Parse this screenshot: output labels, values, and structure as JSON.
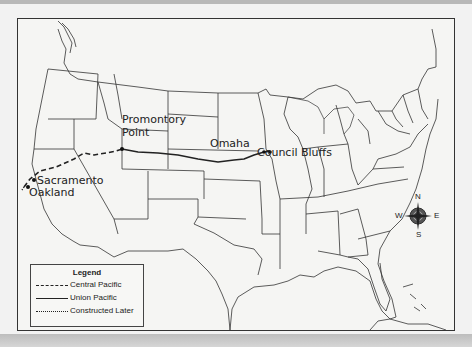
{
  "map": {
    "subject": "United States — Transcontinental Railroad routes",
    "places": [
      {
        "name": "Promontory Point",
        "line1": "Promontory",
        "line2": "Point"
      },
      {
        "name": "Sacramento"
      },
      {
        "name": "Oakland"
      },
      {
        "name": "Omaha"
      },
      {
        "name": "Council Bluffs"
      }
    ],
    "labels": {
      "promontory_1": "Promontory",
      "promontory_2": "Point",
      "sacramento": "Sacramento",
      "oakland": "Oakland",
      "omaha": "Omaha",
      "council_bluffs": "Council Bluffs"
    },
    "compass": {
      "n": "N",
      "s": "S",
      "e": "E",
      "w": "W"
    },
    "legend": {
      "title": "Legend",
      "items": [
        {
          "label": "Central Pacific",
          "style": "dashed"
        },
        {
          "label": "Union Pacific",
          "style": "solid"
        },
        {
          "label": "Constructed Later",
          "style": "dotted"
        }
      ]
    },
    "colors": {
      "background": "#f5f5f3",
      "outline": "#333333",
      "route": "#222222",
      "compass": "#555555"
    }
  }
}
